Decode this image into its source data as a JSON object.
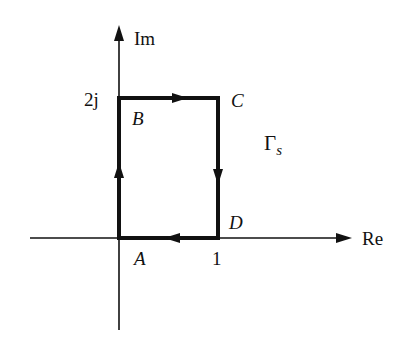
{
  "diagram": {
    "type": "complex-plane-contour",
    "axes": {
      "real_label": "Re",
      "imag_label": "Im"
    },
    "tick_labels": {
      "imag_tick": "2j",
      "real_tick": "1"
    },
    "contour": {
      "name": "Γ",
      "subscript": "s",
      "direction": "clockwise",
      "vertices": [
        {
          "label": "A",
          "value": "0"
        },
        {
          "label": "B",
          "value": "2j"
        },
        {
          "label": "C",
          "value": "1+2j"
        },
        {
          "label": "D",
          "value": "1"
        }
      ],
      "path_order": [
        "A",
        "B",
        "C",
        "D",
        "A"
      ]
    },
    "colors": {
      "line": "#111111",
      "background": "#ffffff"
    }
  }
}
